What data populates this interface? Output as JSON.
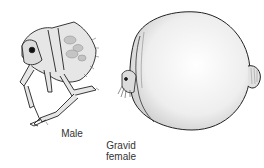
{
  "figure": {
    "labels": {
      "male": "Male",
      "female_line1": "Gravid",
      "female_line2": "female"
    },
    "colors": {
      "outline": "#222222",
      "body_fill": "#e6e6e6",
      "sphere_fill": "#eeeeee",
      "shade": "#c4c4c4"
    }
  }
}
